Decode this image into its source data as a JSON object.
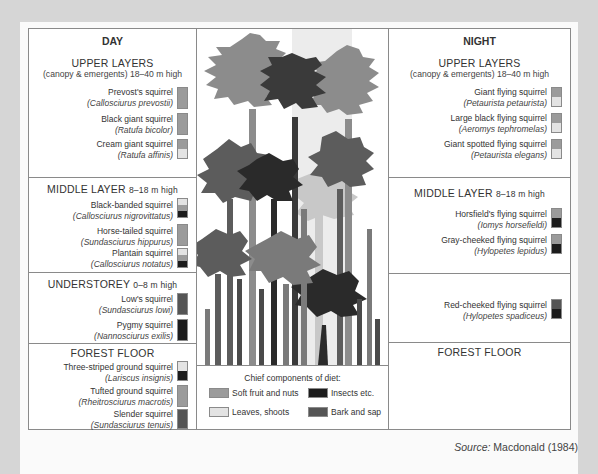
{
  "diagram": {
    "type": "forest stratification of squirrel species with diet components",
    "day": {
      "title": "DAY",
      "sections": [
        {
          "layer": "UPPER LAYERS",
          "height_note": "(canopy & emergents) 18–40 m high",
          "species": [
            {
              "common": "Prevost's squirrel",
              "scientific": "(Callosciurus prevostii)",
              "diet": [
                "fruit"
              ]
            },
            {
              "common": "Black giant squirrel",
              "scientific": "(Ratufa bicolor)",
              "diet": [
                "fruit"
              ]
            },
            {
              "common": "Cream giant squirrel",
              "scientific": "(Ratufa affinis)",
              "diet": [
                "fruit",
                "leaf"
              ]
            }
          ]
        },
        {
          "layer": "MIDDLE LAYER",
          "height_note": "8–18 m high",
          "species": [
            {
              "common": "Black-banded squirrel",
              "scientific": "(Callosciurus nigrovittatus)",
              "diet": [
                "leaf",
                "fruit",
                "insect"
              ]
            },
            {
              "common": "Horse-tailed squirrel",
              "scientific": "(Sundasciurus hippurus)",
              "diet": [
                "fruit"
              ]
            },
            {
              "common": "Plantain squirrel",
              "scientific": "(Callosciurus notatus)",
              "diet": [
                "leaf",
                "fruit",
                "insect"
              ]
            }
          ]
        },
        {
          "layer": "UNDERSTOREY",
          "height_note": "0–8 m high",
          "species": [
            {
              "common": "Low's squirrel",
              "scientific": "(Sundasciurus lowi)",
              "diet": [
                "bark"
              ]
            },
            {
              "common": "Pygmy squirrel",
              "scientific": "(Nannosciurus exilis)",
              "diet": [
                "insect"
              ]
            }
          ]
        },
        {
          "layer": "FOREST FLOOR",
          "height_note": "",
          "species": [
            {
              "common": "Three-striped ground squirrel",
              "scientific": "(Lariscus insignis)",
              "diet": [
                "leaf",
                "insect"
              ]
            },
            {
              "common": "Tufted ground squirrel",
              "scientific": "(Rheitrosciurus macrotis)",
              "diet": [
                "fruit"
              ]
            },
            {
              "common": "Slender squirrel",
              "scientific": "(Sundasciurus tenuis)",
              "diet": [
                "bark"
              ]
            }
          ]
        }
      ]
    },
    "night": {
      "title": "NIGHT",
      "sections": [
        {
          "layer": "UPPER LAYERS",
          "height_note": "(canopy & emergents) 18–40 m high",
          "species": [
            {
              "common": "Giant flying squirrel",
              "scientific": "(Petaurista petaurista)",
              "diet": [
                "fruit",
                "leaf"
              ]
            },
            {
              "common": "Large black flying squirrel",
              "scientific": "(Aeromys tephromelas)",
              "diet": [
                "fruit",
                "leaf"
              ]
            },
            {
              "common": "Giant spotted flying squirrel",
              "scientific": "(Petaurista elegans)",
              "diet": [
                "fruit",
                "leaf"
              ]
            }
          ]
        },
        {
          "layer": "MIDDLE LAYER",
          "height_note": "8–18 m high",
          "species": [
            {
              "common": "Horsfield's flying squirrel",
              "scientific": "(Iomys horsefieldi)",
              "diet": [
                "fruit",
                "insect"
              ]
            },
            {
              "common": "Gray-cheeked flying squirrel",
              "scientific": "(Hylopetes lepidus)",
              "diet": [
                "fruit",
                "insect"
              ]
            }
          ]
        },
        {
          "layer": "",
          "height_note": "",
          "species": [
            {
              "common": "Red-cheeked flying squirrel",
              "scientific": "(Hylopetes spadiceus)",
              "diet": [
                "bark",
                "insect"
              ]
            }
          ]
        },
        {
          "layer": "FOREST FLOOR",
          "height_note": "",
          "species": []
        }
      ]
    },
    "legend": {
      "title": "Chief components of diet:",
      "items": [
        {
          "key": "fruit",
          "label": "Soft fruit and nuts",
          "color": "#9b9b9b"
        },
        {
          "key": "insect",
          "label": "Insects etc.",
          "color": "#1c1c1c"
        },
        {
          "key": "leaf",
          "label": "Leaves, shoots",
          "color": "#e3e3e3"
        },
        {
          "key": "bark",
          "label": "Bark and sap",
          "color": "#555555"
        }
      ]
    },
    "source": {
      "prefix": "Source:",
      "text": "Macdonald (1984)"
    }
  }
}
